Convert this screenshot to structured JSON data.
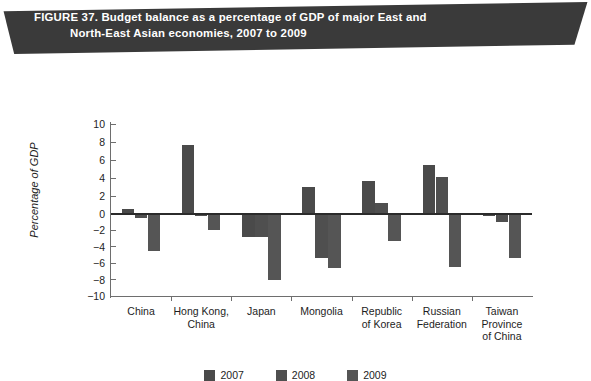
{
  "figure": {
    "banner_line1": "FIGURE 37. Budget balance as a percentage of GDP of major East and",
    "banner_line2": "North-East Asian economies, 2007 to 2009",
    "banner_color": "#3a3a3a",
    "banner_text_color": "#ffffff"
  },
  "chart_data": {
    "type": "bar",
    "title": "FIGURE 37. Budget balance as a percentage of GDP of major East and North-East Asian economies, 2007 to 2009",
    "xlabel": "",
    "ylabel": "Percentage of GDP",
    "ylim": [
      -10,
      10
    ],
    "ytick_labels": [
      "10",
      "8",
      "6",
      "4",
      "2",
      "0",
      "−2",
      "−4",
      "−6",
      "−8",
      "−10"
    ],
    "ytick_values": [
      10,
      8,
      6,
      4,
      2,
      0,
      -2,
      -4,
      -6,
      -8,
      -10
    ],
    "grid": false,
    "legend_position": "bottom",
    "categories": [
      "China",
      "Hong Kong,\nChina",
      "Japan",
      "Mongolia",
      "Republic\nof Korea",
      "Russian\nFederation",
      "Taiwan\nProvince\nof China"
    ],
    "series": [
      {
        "name": "2007",
        "color": "#4a4a4a",
        "values": [
          0.6,
          7.7,
          -2.5,
          3.0,
          3.7,
          5.4,
          -0.2
        ]
      },
      {
        "name": "2008",
        "color": "#4f4f4f",
        "values": [
          -0.4,
          -0.2,
          -2.5,
          -4.9,
          1.2,
          4.1,
          -0.9
        ]
      },
      {
        "name": "2009",
        "color": "#555555",
        "values": [
          -4.1,
          -1.8,
          -7.3,
          -6.0,
          -3.0,
          -5.9,
          -4.9
        ]
      }
    ]
  },
  "legend": {
    "items": [
      {
        "label": "2007",
        "color": "#4a4a4a"
      },
      {
        "label": "2008",
        "color": "#4f4f4f"
      },
      {
        "label": "2009",
        "color": "#555555"
      }
    ]
  }
}
